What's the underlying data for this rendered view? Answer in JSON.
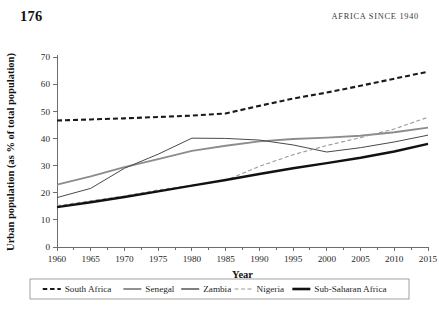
{
  "page": {
    "folio": "176",
    "running_head": "AFRICA SINCE 1940"
  },
  "chart_data": {
    "type": "line",
    "title": "",
    "xlabel": "Year",
    "ylabel": "Urban population (as % of total population)",
    "xlim": [
      1960,
      2015
    ],
    "ylim": [
      0,
      70
    ],
    "xticks": [
      1960,
      1965,
      1970,
      1975,
      1980,
      1985,
      1990,
      1995,
      2000,
      2005,
      2010,
      2015
    ],
    "yticks": [
      0,
      10,
      20,
      30,
      40,
      50,
      60,
      70
    ],
    "grid": false,
    "legend_position": "bottom",
    "x": [
      1960,
      1965,
      1970,
      1975,
      1980,
      1985,
      1990,
      1995,
      2000,
      2005,
      2010,
      2015
    ],
    "series": [
      {
        "name": "South Africa",
        "color": "#1a1a1a",
        "width": 2.1,
        "dash": "5,3",
        "values": [
          46.6,
          47.0,
          47.4,
          47.9,
          48.4,
          49.2,
          52.0,
          54.7,
          56.9,
          59.4,
          62.0,
          64.6
        ]
      },
      {
        "name": "Senegal",
        "color": "#8c8c8c",
        "width": 1.9,
        "dash": "none",
        "values": [
          23.0,
          26.0,
          29.4,
          32.4,
          35.4,
          37.3,
          38.9,
          39.8,
          40.3,
          41.0,
          42.3,
          44.0
        ]
      },
      {
        "name": "Zambia",
        "color": "#4a4a4a",
        "width": 1.0,
        "dash": "none",
        "values": [
          18.2,
          21.6,
          29.0,
          34.2,
          40.1,
          40.0,
          39.4,
          37.6,
          35.0,
          36.6,
          38.7,
          41.2
        ]
      },
      {
        "name": "Nigeria",
        "color": "#9a9a9a",
        "width": 1.1,
        "dash": "4,2.5",
        "values": [
          15.2,
          17.0,
          18.8,
          21.0,
          22.7,
          24.5,
          29.7,
          34.0,
          37.4,
          40.3,
          43.5,
          47.8
        ]
      },
      {
        "name": "Sub-Saharan Africa",
        "color": "#111111",
        "width": 2.4,
        "dash": "none",
        "values": [
          14.7,
          16.5,
          18.4,
          20.5,
          22.6,
          24.7,
          26.9,
          29.0,
          30.9,
          32.9,
          35.2,
          38.0
        ]
      }
    ],
    "legend": [
      {
        "label": "South Africa",
        "color": "#1a1a1a",
        "width": 2.1,
        "dash": "4.5,2.8"
      },
      {
        "label": "Senegal",
        "color": "#8c8c8c",
        "width": 1.9,
        "dash": "none"
      },
      {
        "label": "Zambia",
        "color": "#4a4a4a",
        "width": 1.4,
        "dash": "none"
      },
      {
        "label": "Nigeria",
        "color": "#9a9a9a",
        "width": 1.1,
        "dash": "4,2.5"
      },
      {
        "label": "Sub-Saharan Africa",
        "color": "#111111",
        "width": 2.6,
        "dash": "none"
      }
    ]
  }
}
